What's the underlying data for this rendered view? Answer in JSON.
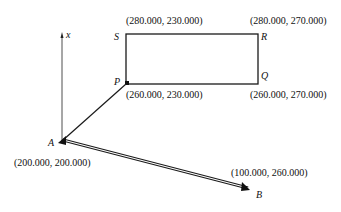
{
  "diagram": {
    "axis": {
      "label": "x"
    },
    "points": {
      "S": {
        "name": "S",
        "coord": "(280.000, 230.000)"
      },
      "R": {
        "name": "R",
        "coord": "(280.000, 270.000)"
      },
      "P": {
        "name": "P",
        "coord": "(260.000, 230.000)"
      },
      "Q": {
        "name": "Q",
        "coord": "(260.000, 270.000)"
      },
      "A": {
        "name": "A",
        "coord": "(200.000, 200.000)"
      },
      "B": {
        "name": "B",
        "coord": "(100.000, 260.000)"
      }
    },
    "colors": {
      "line": "#1a1a1a",
      "background": "#ffffff"
    }
  }
}
